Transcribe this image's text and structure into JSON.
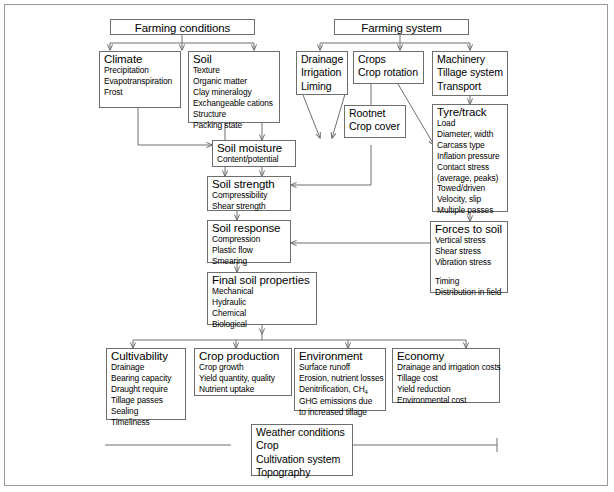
{
  "diagram": {
    "stroke_color": "#6e6e6e",
    "frame_color": "#9a9a9a",
    "nodes": {
      "farming_conditions": {
        "title": "Farming conditions",
        "items": []
      },
      "farming_system": {
        "title": "Farming system",
        "items": []
      },
      "climate": {
        "title": "Climate",
        "items": [
          "Precipitation",
          "Evapotranspiration",
          "Frost"
        ]
      },
      "soil": {
        "title": "Soil",
        "items": [
          "Texture",
          "Organic matter",
          "Clay mineralogy",
          "Exchangeable cations",
          "Structure",
          "Packing state"
        ]
      },
      "drainage": {
        "lines": [
          "Drainage",
          "Irrigation",
          "Liming"
        ]
      },
      "crops": {
        "lines": [
          "Crops",
          "Crop rotation"
        ]
      },
      "machinery": {
        "lines": [
          "Machinery",
          "Tillage system",
          "Transport"
        ]
      },
      "rootnet": {
        "lines": [
          "Rootnet",
          "Crop cover"
        ]
      },
      "tyre_track": {
        "title": "Tyre/track",
        "items": [
          "Load",
          "Diameter, width",
          "Carcass type",
          "Inflation pressure",
          "Contact stress",
          "(average, peaks)",
          "Towed/driven",
          "Velocity, slip",
          "Multiple passes",
          "",
          "Onland/furrow"
        ]
      },
      "soil_moisture": {
        "title": "Soil moisture",
        "items": [
          "Content/potential"
        ]
      },
      "soil_strength": {
        "title": "Soil strength",
        "items": [
          "Compressibility",
          "Shear strength"
        ]
      },
      "soil_response": {
        "title": "Soil response",
        "items": [
          "Compression",
          "Plastic flow",
          "Smearing"
        ]
      },
      "forces_to_soil": {
        "title": "Forces to soil",
        "items": [
          "Vertical stress",
          "Shear stress",
          "Vibration stress",
          "",
          "Timing",
          "Distribution in field"
        ]
      },
      "final_soil_properties": {
        "title": "Final soil properties",
        "items": [
          "Mechanical",
          "Hydraulic",
          "Chemical",
          "Biological"
        ]
      },
      "cultivability": {
        "title": "Cultivability",
        "items": [
          "Drainage",
          "Bearing capacity",
          "Draught require",
          "Tillage passes",
          "Sealing",
          "Timeliness"
        ]
      },
      "crop_production": {
        "title": "Crop production",
        "items": [
          "Crop growth",
          "Yield quantity, quality",
          "Nutrient uptake"
        ]
      },
      "environment": {
        "title": "Environment",
        "items": [
          "Surface runoff",
          "Erosion, nutrient losses",
          "Denitrification, CH4",
          "GHG emissions due",
          "to increased tillage"
        ]
      },
      "economy": {
        "title": "Economy",
        "items": [
          "Drainage and irrigation costs",
          "Tillage cost",
          "Yield reduction",
          "Environmental cost"
        ]
      },
      "weather_conditions": {
        "lines": [
          "Weather conditions",
          "Crop",
          "Cultivation system",
          "Topography"
        ]
      }
    }
  }
}
